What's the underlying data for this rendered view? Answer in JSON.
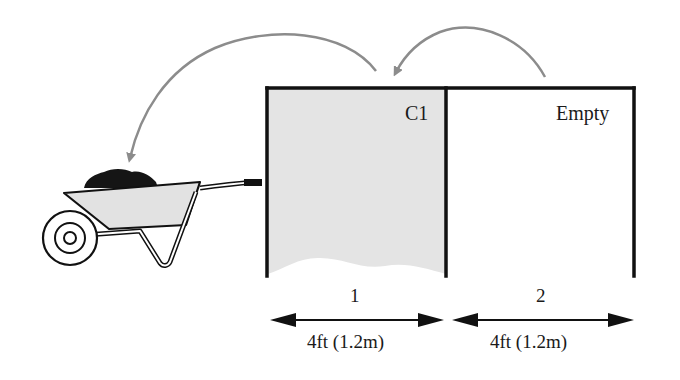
{
  "diagram": {
    "bins": [
      {
        "number": "1",
        "tag": "C1",
        "content": "filled",
        "width_label": "4ft (1.2m)"
      },
      {
        "number": "2",
        "tag": "Empty",
        "content": "empty",
        "width_label": "4ft (1.2m)"
      }
    ],
    "objects": {
      "wheelbarrow": "wheelbarrow-with-compost"
    },
    "arrows": [
      {
        "from": "bin-2",
        "to": "bin-1",
        "meaning": "turn compost from bin 2 into bin 1"
      },
      {
        "from": "bin-1",
        "to": "wheelbarrow",
        "meaning": "remove compost from bin 1 to wheelbarrow"
      }
    ],
    "colors": {
      "outline": "#111111",
      "compost_fill": "#e4e4e4",
      "arrow": "#8c8c8c",
      "background": "#ffffff"
    }
  }
}
